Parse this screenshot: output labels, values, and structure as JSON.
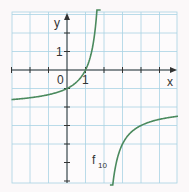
{
  "chart_data": {
    "type": "line",
    "title": "",
    "xlabel": "x",
    "ylabel": "y",
    "xlim": [
      -3,
      6
    ],
    "ylim": [
      -6,
      3
    ],
    "grid": true,
    "tick_labels": {
      "x": [
        "0",
        "1"
      ],
      "y": [
        "1"
      ]
    },
    "series": [
      {
        "name": "f10",
        "formula": "f(x) = -2/(x-2) - 2",
        "vertical_asymptote": 2,
        "horizontal_asymptote": -2,
        "points_left_branch": [
          [
            -3,
            -1.6
          ],
          [
            -2,
            -1.5
          ],
          [
            -1,
            -1.33
          ],
          [
            0,
            -1
          ],
          [
            1,
            0
          ],
          [
            1.5,
            2
          ],
          [
            1.75,
            6
          ]
        ],
        "points_right_branch": [
          [
            2.3,
            -8.7
          ],
          [
            2.5,
            -6
          ],
          [
            3,
            -4
          ],
          [
            4,
            -3
          ],
          [
            5,
            -2.67
          ],
          [
            6,
            -2.5
          ]
        ]
      }
    ]
  },
  "labels": {
    "x_axis": "x",
    "y_axis": "y",
    "origin": "0",
    "x_one": "1",
    "y_one": "1",
    "curve_name": "f",
    "curve_subscript": "10"
  },
  "colors": {
    "curve": "#4b8a5e",
    "grid": "#a8d3e3",
    "axis": "#333333",
    "background": "#fbf8f9"
  }
}
